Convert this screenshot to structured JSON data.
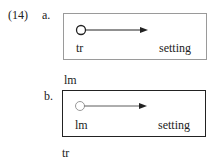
{
  "example": {
    "number": "(14)",
    "a": {
      "label": "a.",
      "inside_left": "tr",
      "inside_right": "setting",
      "below": "lm",
      "circle": "hollow-dark"
    },
    "b": {
      "label": "b.",
      "inside_left": "lm",
      "inside_right": "setting",
      "below": "tr",
      "circle": "hollow-light"
    }
  }
}
